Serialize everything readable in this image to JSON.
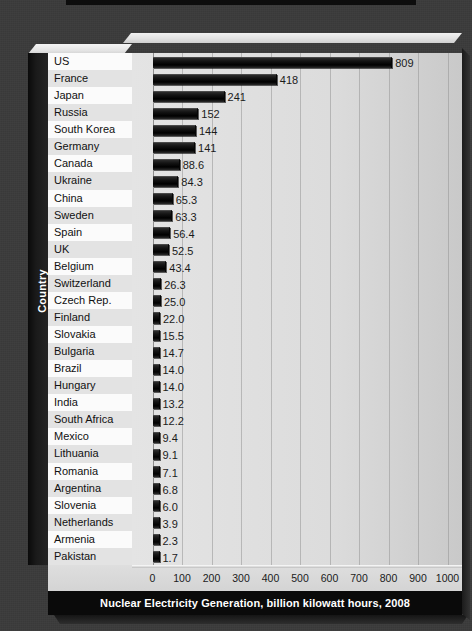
{
  "chart_data": {
    "type": "bar",
    "orientation": "horizontal",
    "title": "Nuclear Electricity Generation, billion kilowatt hours, 2008",
    "xlabel": "",
    "ylabel": "Country",
    "xlim": [
      0,
      1000
    ],
    "xticks": [
      "0",
      "100",
      "200",
      "300",
      "400",
      "500",
      "600",
      "700",
      "800",
      "900",
      "1000"
    ],
    "grid": "vertical",
    "legend": "none",
    "categories": [
      "US",
      "France",
      "Japan",
      "Russia",
      "South Korea",
      "Germany",
      "Canada",
      "Ukraine",
      "China",
      "Sweden",
      "Spain",
      "UK",
      "Belgium",
      "Switzerland",
      "Czech Rep.",
      "Finland",
      "Slovakia",
      "Bulgaria",
      "Brazil",
      "Hungary",
      "India",
      "South Africa",
      "Mexico",
      "Lithuania",
      "Romania",
      "Argentina",
      "Slovenia",
      "Netherlands",
      "Armenia",
      "Pakistan"
    ],
    "values": [
      809,
      418,
      241,
      152,
      144,
      141,
      88.6,
      84.3,
      65.3,
      63.3,
      56.4,
      52.5,
      43.4,
      26.3,
      25.0,
      22.0,
      15.5,
      14.7,
      14.0,
      14.0,
      13.2,
      12.2,
      9.4,
      9.1,
      7.1,
      6.8,
      6.0,
      3.9,
      2.3,
      1.7
    ],
    "value_labels": [
      "809",
      "418",
      "241",
      "152",
      "144",
      "141",
      "88.6",
      "84.3",
      "65.3",
      "63.3",
      "56.4",
      "52.5",
      "43.4",
      "26.3",
      "25.0",
      "22.0",
      "15.5",
      "14.7",
      "14.0",
      "14.0",
      "13.2",
      "12.2",
      "9.4",
      "9.1",
      "7.1",
      "6.8",
      "6.0",
      "3.9",
      "2.3",
      "1.7"
    ]
  },
  "colors": {
    "backdrop": "#3b3b3b",
    "bar": "#0a0a0a",
    "plot_background": "#dddddd",
    "row_band_light": "#fbfbfb",
    "row_band_dark": "#e3e3e3",
    "title_bar": "#0a0a0a",
    "title_text": "#ffffff",
    "axis_text": "#1b1b1b"
  }
}
